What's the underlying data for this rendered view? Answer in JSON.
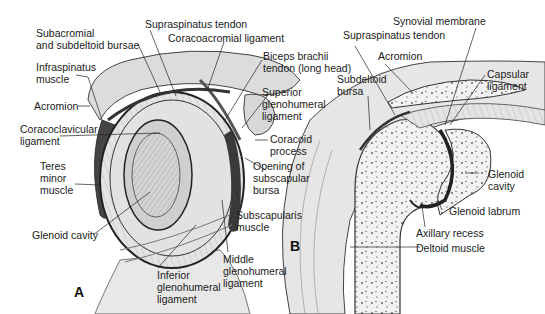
{
  "figure": {
    "panel_a": {
      "letter": "A",
      "labels": [
        {
          "id": "subacromial",
          "text": "Subacromial\nand subdeltoid bursae"
        },
        {
          "id": "supraspinatus",
          "text": "Supraspinatus tendon"
        },
        {
          "id": "coracoacromial",
          "text": "Coracoacromial ligament"
        },
        {
          "id": "biceps",
          "text": "Biceps brachii\ntendon (long head)"
        },
        {
          "id": "infraspinatus",
          "text": "Infraspinatus\nmuscle"
        },
        {
          "id": "acromion",
          "text": "Acromion"
        },
        {
          "id": "superior-gh",
          "text": "Superior\nglenohumeral\nligament"
        },
        {
          "id": "coracoclavicular",
          "text": "Coracoclavicular\nligament"
        },
        {
          "id": "coracoid",
          "text": "Coracoid\nprocess"
        },
        {
          "id": "opening-subscap",
          "text": "Opening of\nsubscapular\nbursa"
        },
        {
          "id": "teres-minor",
          "text": "Teres\nminor\nmuscle"
        },
        {
          "id": "glenoid-cavity",
          "text": "Glenoid cavity"
        },
        {
          "id": "subscapularis",
          "text": "Subscapularis\nmuscle"
        },
        {
          "id": "middle-gh",
          "text": "Middle\nglenohumeral\nligament"
        },
        {
          "id": "inferior-gh",
          "text": "Inferior\nglenohumeral\nligament"
        }
      ]
    },
    "panel_b": {
      "letter": "B",
      "labels": [
        {
          "id": "synovial",
          "text": "Synovial membrane"
        },
        {
          "id": "supraspinatus-b",
          "text": "Supraspinatus tendon"
        },
        {
          "id": "acromion-b",
          "text": "Acromion"
        },
        {
          "id": "subdeltoid",
          "text": "Subdeltoid\nbursa"
        },
        {
          "id": "capsular",
          "text": "Capsular\nligament"
        },
        {
          "id": "glenoid-cavity-b",
          "text": "Glenoid\ncavity"
        },
        {
          "id": "glenoid-labrum",
          "text": "Glenoid labrum"
        },
        {
          "id": "axillary",
          "text": "Axillary recess"
        },
        {
          "id": "deltoid",
          "text": "Deltoid muscle"
        }
      ]
    }
  }
}
